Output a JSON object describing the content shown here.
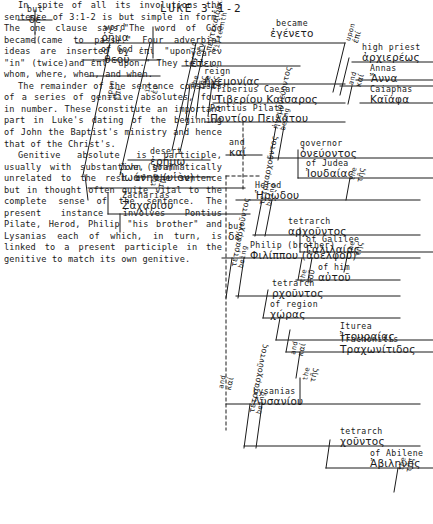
{
  "title": "LUKE 3:1-2",
  "diagram": {
    "type": "greek-sentence-diagram",
    "reference": "Luke 3:1-2",
    "nodes": {
      "but": {
        "eng": "but",
        "grk": "δὲ"
      },
      "word": {
        "eng": "word",
        "grk": "ῥῆμα"
      },
      "of_god": {
        "eng": "of God",
        "grk": "θεοῦ"
      },
      "became": {
        "eng": "became",
        "grk": "ἐγένετο"
      },
      "upon1": {
        "eng": "upon",
        "grk": "ἐπί"
      },
      "in1": {
        "eng": "in",
        "grk": "ἐν"
      },
      "in2": {
        "eng": "in",
        "grk": "ἐν"
      },
      "desert": {
        "eng": "desert",
        "grk": "ἐρήμῳ"
      },
      "the_desert": {
        "eng": "the",
        "grk": "τῇ"
      },
      "john": {
        "eng": "John  (son)",
        "grk": "Ἰωάνην (υἱὸν)"
      },
      "zacharias": {
        "eng": "Zacharias",
        "grk": "Ζαχαρίου"
      },
      "fifteenth": {
        "eng": "fifteenth",
        "grk": "πεντεκαιδεκάτῳ"
      },
      "year": {
        "eng": "year",
        "grk": "ἔτει"
      },
      "the_year": {
        "eng": "the",
        "grk": "τῆς"
      },
      "reign": {
        "eng": "reign",
        "grk": "ἡγεμονίας"
      },
      "the_reign": {
        "eng": "the",
        "grk": "τῆς"
      },
      "tiberius_caesar": {
        "eng": "Tiberius     Caesar",
        "grk": "Τιβερίου Καίσαρος"
      },
      "pontius_pilate": {
        "eng": "Pontius    Pilate",
        "grk": "Ποντίου Πειλάτου"
      },
      "upon2": {
        "eng": "upon",
        "grk": "ἐπί"
      },
      "high_priest": {
        "eng": "high priest",
        "grk": "ἀρχιερέως"
      },
      "annas": {
        "eng": "Annas",
        "grk": "Ἄννα"
      },
      "caiaphas": {
        "eng": "Caiaphas",
        "grk": "Καϊάφα"
      },
      "and_caiaphas": {
        "eng": "and",
        "grk": "καί"
      },
      "being_governor": {
        "eng": "being",
        "grk": "ἡγεμονεύοντος"
      },
      "governor": {
        "eng": "governor",
        "grk": "ὀνεύοντος"
      },
      "of_judea": {
        "eng": "of Judea",
        "grk": "Ἰουδαίας"
      },
      "the_judea": {
        "eng": "the",
        "grk": "τῆς"
      },
      "and_herod": {
        "eng": "and",
        "grk": "καί"
      },
      "herod": {
        "eng": "Herod",
        "grk": "Ἡρῴδου"
      },
      "being_tetrarch1": {
        "eng": "being",
        "grk": "τετρααρχοῦντος"
      },
      "tetrarch1": {
        "eng": "tetrarch",
        "grk": "αρχοῦντος"
      },
      "of_galilee": {
        "eng": "of Galilee",
        "grk": "Γαλιλαίας"
      },
      "the_galilee": {
        "eng": "the",
        "grk": "τῆς"
      },
      "but_philip": {
        "eng": "but",
        "grk": "δὲ"
      },
      "philip": {
        "eng": "Philip  (brother)",
        "grk": "Φιλίππου (ἀδελφοῦ)"
      },
      "of_him": {
        "eng": "of him",
        "grk": "αὐτοῦ"
      },
      "the_him": {
        "eng": "the",
        "grk": "τοῦ"
      },
      "being_tetrarch2": {
        "eng": "being",
        "grk": "τετρααρχοῦντος"
      },
      "tetrarch2": {
        "eng": "tetrarch",
        "grk": "ρχοῦντος"
      },
      "of_region": {
        "eng": "of region",
        "grk": "χώρας"
      },
      "the_region": {
        "eng": "the",
        "grk": "τῆς"
      },
      "iturea": {
        "eng": "Iturea",
        "grk": "Ἰτουραίας"
      },
      "trachonitis": {
        "eng": "Trachonitis",
        "grk": "Τραχωνίτιδος"
      },
      "and_trach": {
        "eng": "and",
        "grk": "καί"
      },
      "the_trach": {
        "eng": "the",
        "grk": "τῆς"
      },
      "and_lysanias": {
        "eng": "and",
        "grk": "καί"
      },
      "lysanias": {
        "eng": "Lysanias",
        "grk": "Λυσανίου"
      },
      "being_tetrarch3": {
        "eng": "being",
        "grk": "τετρααρχοῦντος"
      },
      "tetrarch3": {
        "eng": "tetrarch",
        "grk": "χοῦντος"
      },
      "of_abilene": {
        "eng": "of Abilene",
        "grk": "Ἀβιληνῆς"
      },
      "the_abilene": {
        "eng": "the",
        "grk": "τῆς"
      }
    }
  },
  "prose": {
    "para1": "In spite of all its involutions the sentence of 3:1-2 is but simple in form. The one clause says,\"The word of God became(came to pass).\" Four adverbial ideas are inserted by ἐπὶ \"upon,\" ἐν \"in\" (twice)and ἐπὶ \"upon.\" They tell on whom, where, when, and when.",
    "para2": "The remainder of the sentence consists of a series of genitive absolutes, four in number. These constitute an important part in Luke's dating of the beginning of John the Baptist's ministry and hence that of the Christ's.",
    "para3": "Genitive absolute is participle, usually with substantive, grammatically unrelated to the rest of the sentence but in thought often quite vital to the complete sense of the sentence. The present instance involves Pontius Pilate, Herod, Philip \"his brother\" and Lysanias each of which, in turn, is linked to a present participle in the genitive to match its own genitive."
  }
}
